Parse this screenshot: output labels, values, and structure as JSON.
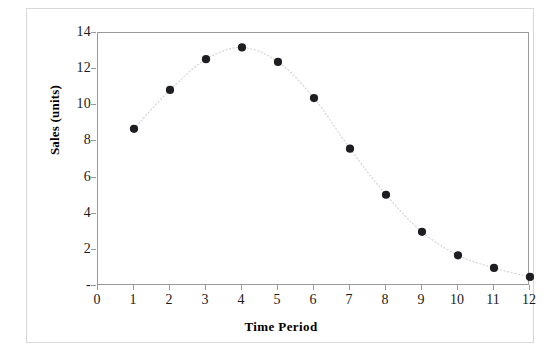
{
  "chart_data": {
    "type": "scatter",
    "title": "",
    "xlabel": "Time Period",
    "ylabel": "Sales (units)",
    "x": [
      1,
      2,
      3,
      4,
      5,
      6,
      7,
      8,
      9,
      10,
      11,
      12
    ],
    "values": [
      8.7,
      10.85,
      12.55,
      13.2,
      12.4,
      10.4,
      7.6,
      5.05,
      3.0,
      1.7,
      1.0,
      0.5
    ],
    "series": [
      {
        "name": "Sales",
        "values": [
          8.7,
          10.85,
          12.55,
          13.2,
          12.4,
          10.4,
          7.6,
          5.05,
          3.0,
          1.7,
          1.0,
          0.5
        ],
        "marker": "filled-circle",
        "color": "#1e1e22"
      }
    ],
    "trendline": {
      "present": true,
      "style": "dotted",
      "color": "#d2d2d2"
    },
    "xlim": [
      0,
      12
    ],
    "ylim": [
      0,
      14
    ],
    "x_ticks": [
      "0",
      "1",
      "2",
      "3",
      "4",
      "5",
      "6",
      "7",
      "8",
      "9",
      "10",
      "11",
      "12"
    ],
    "x_tick_values": [
      0,
      1,
      2,
      3,
      4,
      5,
      6,
      7,
      8,
      9,
      10,
      11,
      12
    ],
    "y_ticks": [
      "-",
      "2",
      "4",
      "6",
      "8",
      "10",
      "12",
      "14"
    ],
    "y_tick_values": [
      0,
      2,
      4,
      6,
      8,
      10,
      12,
      14
    ],
    "grid": false,
    "legend": false,
    "frame": true,
    "colors": {
      "marker": "#1e1e22",
      "trendline": "#d2d2d2",
      "axis": "#9a9a9a",
      "border": "#d8d8d8",
      "background": "#ffffff",
      "text": "#1a1a1a"
    }
  }
}
